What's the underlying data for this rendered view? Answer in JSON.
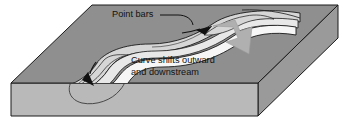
{
  "figure": {
    "type": "geology-block-diagram",
    "width": 348,
    "height": 128
  },
  "labels": [
    {
      "id": "point-bars",
      "text": "Point bars",
      "x": 112,
      "y": 15,
      "has_leader_line": true
    },
    {
      "id": "curve-shifts-line1",
      "text": "Curve shifts outward",
      "x": 131,
      "y": 61
    },
    {
      "id": "curve-shifts-line2",
      "text": "and downstream",
      "x": 131,
      "y": 73
    }
  ],
  "annotations": {
    "flow_arrows": 2,
    "migration_arrow": "large-gray-arrow-down-right"
  },
  "colors": {
    "background": "#ffffff",
    "block_top": "#8f8f8f",
    "block_front": "#b9b9b9",
    "block_right": "#9a9a9a",
    "outline": "#1a1a1a",
    "channel_water": "#f4f4f4",
    "point_bar": "#d6d6d6",
    "migration_arrow": "#b0b0b0",
    "flow_arrow": "#111111",
    "text": "#111111"
  }
}
